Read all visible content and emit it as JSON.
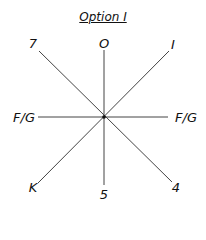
{
  "title": "Option I",
  "center": {
    "x": 104,
    "y": 117
  },
  "labels": {
    "top": "O",
    "top_right": "I",
    "right": "F/G",
    "bottom_right": "4",
    "bottom": "5",
    "bottom_left": "K",
    "left": "F/G",
    "top_left": "7"
  },
  "colors": {
    "line": "#444444",
    "text": "#111111"
  }
}
